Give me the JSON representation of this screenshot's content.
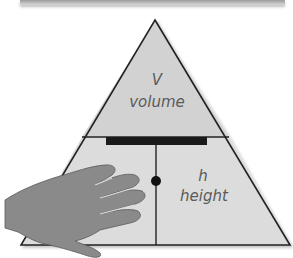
{
  "diagram": {
    "type": "formula-triangle",
    "top": {
      "symbol": "V",
      "label": "volume"
    },
    "bottom_left": {
      "symbol": "b",
      "label": "base",
      "visible_text": "ase"
    },
    "bottom_right": {
      "symbol": "h",
      "label": "height"
    },
    "colors": {
      "triangle_top_fill": "#d2d2d2",
      "triangle_bottom_fill": "#dcdcdc",
      "outline": "#222222",
      "divider_bar": "#1a1a1a",
      "hand_fill": "#8a8a8a",
      "text": "#5a5a5a"
    },
    "annotations": {
      "hand_covering": "bottom_left",
      "divider_bar": "division",
      "dot": "multiplication"
    }
  }
}
